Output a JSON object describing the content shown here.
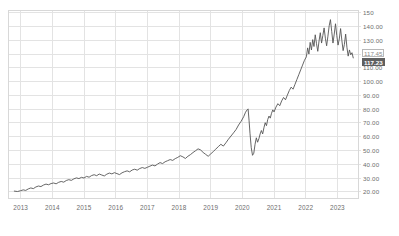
{
  "chart_data": {
    "type": "line",
    "title": "",
    "subtitle": "",
    "xlabel": "",
    "ylabel": "",
    "xlim": [
      2012.6,
      2023.65
    ],
    "ylim": [
      15.5,
      152.0
    ],
    "grid": true,
    "legend": null,
    "y_ticks": [
      {
        "value": 150,
        "label": "150"
      },
      {
        "value": 140,
        "label": "140.00"
      },
      {
        "value": 130,
        "label": "130.00"
      },
      {
        "value": 120,
        "label": "120.00"
      },
      {
        "value": 110,
        "label": "110.00"
      },
      {
        "value": 100,
        "label": "100.00"
      },
      {
        "value": 90,
        "label": "90.00"
      },
      {
        "value": 80,
        "label": "80.00"
      },
      {
        "value": 70,
        "label": "70.00"
      },
      {
        "value": 60,
        "label": "60.00"
      },
      {
        "value": 50,
        "label": "50.00"
      },
      {
        "value": 40,
        "label": "40.00"
      },
      {
        "value": 30,
        "label": "30.00"
      },
      {
        "value": 20,
        "label": "20.00"
      }
    ],
    "x_ticks": [
      {
        "value": 2013,
        "label": "2013"
      },
      {
        "value": 2014,
        "label": "2014"
      },
      {
        "value": 2015,
        "label": "2015"
      },
      {
        "value": 2016,
        "label": "2016"
      },
      {
        "value": 2017,
        "label": "2017"
      },
      {
        "value": 2018,
        "label": "2018"
      },
      {
        "value": 2019,
        "label": "2019"
      },
      {
        "value": 2020,
        "label": "2020"
      },
      {
        "value": 2021,
        "label": "2021"
      },
      {
        "value": 2022,
        "label": "2022"
      },
      {
        "value": 2023,
        "label": "2023"
      }
    ],
    "hidden_y_tick_labels": [
      120
    ],
    "series": [
      {
        "name": "price",
        "color": "#555555",
        "x": [
          2012.8,
          2012.9,
          2013.0,
          2013.08,
          2013.16,
          2013.24,
          2013.32,
          2013.4,
          2013.48,
          2013.56,
          2013.64,
          2013.72,
          2013.8,
          2013.88,
          2013.96,
          2014.04,
          2014.12,
          2014.2,
          2014.28,
          2014.36,
          2014.44,
          2014.52,
          2014.6,
          2014.68,
          2014.76,
          2014.84,
          2014.92,
          2015.0,
          2015.08,
          2015.16,
          2015.24,
          2015.32,
          2015.4,
          2015.48,
          2015.56,
          2015.64,
          2015.72,
          2015.8,
          2015.88,
          2015.96,
          2016.04,
          2016.12,
          2016.2,
          2016.28,
          2016.36,
          2016.44,
          2016.52,
          2016.6,
          2016.68,
          2016.76,
          2016.84,
          2016.92,
          2017.0,
          2017.08,
          2017.16,
          2017.24,
          2017.32,
          2017.4,
          2017.48,
          2017.56,
          2017.64,
          2017.72,
          2017.8,
          2017.88,
          2017.96,
          2018.04,
          2018.12,
          2018.2,
          2018.28,
          2018.36,
          2018.44,
          2018.52,
          2018.6,
          2018.68,
          2018.76,
          2018.84,
          2018.92,
          2019.0,
          2019.08,
          2019.16,
          2019.24,
          2019.32,
          2019.4,
          2019.48,
          2019.56,
          2019.64,
          2019.72,
          2019.8,
          2019.88,
          2019.96,
          2020.04,
          2020.1,
          2020.15,
          2020.18,
          2020.21,
          2020.24,
          2020.28,
          2020.32,
          2020.36,
          2020.4,
          2020.44,
          2020.48,
          2020.52,
          2020.56,
          2020.6,
          2020.64,
          2020.68,
          2020.72,
          2020.76,
          2020.8,
          2020.84,
          2020.88,
          2020.92,
          2020.96,
          2021.0,
          2021.06,
          2021.12,
          2021.18,
          2021.24,
          2021.3,
          2021.36,
          2021.42,
          2021.48,
          2021.54,
          2021.6,
          2021.66,
          2021.72,
          2021.78,
          2021.84,
          2021.9,
          2021.96,
          2022.02,
          2022.06,
          2022.1,
          2022.14,
          2022.18,
          2022.22,
          2022.26,
          2022.3,
          2022.34,
          2022.38,
          2022.42,
          2022.46,
          2022.5,
          2022.54,
          2022.58,
          2022.62,
          2022.66,
          2022.7,
          2022.74,
          2022.78,
          2022.82,
          2022.86,
          2022.9,
          2022.94,
          2022.98,
          2023.02,
          2023.06,
          2023.1,
          2023.14,
          2023.18,
          2023.22,
          2023.26,
          2023.3,
          2023.34,
          2023.38,
          2023.42,
          2023.46,
          2023.5
        ],
        "y": [
          20.5,
          20.2,
          20.8,
          21.4,
          21.0,
          22.1,
          22.8,
          22.3,
          23.5,
          24.2,
          23.8,
          24.9,
          25.6,
          25.1,
          26.0,
          26.4,
          25.8,
          26.9,
          27.5,
          27.0,
          28.2,
          28.8,
          28.3,
          29.4,
          30.1,
          29.6,
          30.5,
          30.0,
          31.2,
          30.6,
          31.8,
          32.4,
          31.7,
          32.9,
          32.2,
          31.5,
          32.8,
          33.6,
          33.0,
          33.9,
          33.2,
          32.5,
          33.8,
          34.6,
          35.2,
          34.5,
          35.8,
          36.4,
          35.7,
          36.9,
          37.6,
          37.0,
          37.8,
          38.6,
          39.4,
          38.8,
          40.1,
          41.2,
          40.5,
          41.8,
          42.6,
          43.4,
          42.8,
          44.1,
          45.0,
          46.2,
          45.4,
          44.2,
          45.8,
          47.0,
          48.5,
          49.8,
          51.2,
          50.4,
          48.6,
          47.2,
          45.8,
          47.5,
          49.2,
          51.0,
          52.8,
          54.5,
          53.2,
          55.6,
          58.2,
          60.5,
          62.8,
          65.2,
          68.5,
          71.2,
          74.5,
          77.8,
          79.5,
          80.2,
          72.0,
          62.5,
          52.0,
          46.5,
          48.0,
          54.5,
          59.2,
          56.0,
          58.5,
          62.0,
          64.5,
          62.0,
          66.5,
          70.2,
          68.0,
          72.5,
          75.0,
          73.5,
          77.0,
          79.5,
          78.0,
          81.5,
          84.0,
          82.5,
          86.0,
          88.5,
          86.8,
          90.2,
          93.5,
          96.0,
          94.5,
          98.0,
          101.5,
          105.0,
          108.5,
          112.0,
          115.5,
          118.0,
          124.5,
          120.0,
          128.5,
          123.0,
          130.5,
          125.5,
          134.0,
          127.5,
          122.0,
          129.5,
          135.5,
          128.0,
          133.5,
          139.0,
          131.5,
          126.0,
          133.0,
          140.5,
          145.0,
          136.5,
          128.0,
          134.5,
          142.0,
          133.5,
          126.5,
          131.0,
          138.5,
          130.0,
          122.5,
          127.0,
          134.5,
          125.0,
          118.5,
          123.0,
          119.5,
          121.0,
          117.23
        ]
      }
    ],
    "price_markers": [
      {
        "name": "previous-close",
        "label": "117.45",
        "value": 117.45,
        "style": "outline"
      },
      {
        "name": "current-price",
        "label": "117.23",
        "value": 117.23,
        "style": "highlighted"
      }
    ],
    "colors": {
      "line": "#555555",
      "grid": "#e3e3e3",
      "frame": "#d8d8d8",
      "axis_text": "#6e6e6e",
      "marker_fill": "#5f5f5f",
      "marker_text": "#ffffff",
      "marker_outline_text": "#8a8a8a",
      "background": "#ffffff"
    }
  }
}
